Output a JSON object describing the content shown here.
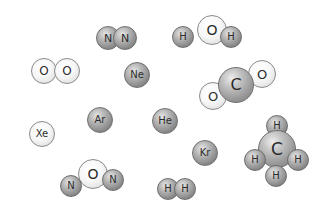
{
  "figure": {
    "colors": {
      "background": "#ffffff",
      "dark_atom": "#9a9a9a",
      "light_atom": "#f4f4f4",
      "outline": "#6e6e6e",
      "label": "#2b2b2b"
    },
    "molecules": [
      {
        "name": "nitrogen-molecule",
        "formula": "N2",
        "atoms": [
          {
            "label": "N",
            "x": 108,
            "y": 38,
            "r": 12,
            "style": "dark"
          },
          {
            "label": "N",
            "x": 125,
            "y": 38,
            "r": 12,
            "style": "dark"
          }
        ]
      },
      {
        "name": "water-molecule",
        "formula": "H2O",
        "atoms": [
          {
            "label": "O",
            "x": 212,
            "y": 30,
            "r": 15,
            "style": "light"
          },
          {
            "label": "H",
            "x": 183,
            "y": 37,
            "r": 11,
            "style": "dark"
          },
          {
            "label": "H",
            "x": 231,
            "y": 37,
            "r": 11,
            "style": "dark"
          }
        ]
      },
      {
        "name": "oxygen-molecule",
        "formula": "O2",
        "atoms": [
          {
            "label": "O",
            "x": 44,
            "y": 71,
            "r": 13,
            "style": "light"
          },
          {
            "label": "O",
            "x": 67,
            "y": 71,
            "r": 13,
            "style": "light"
          }
        ]
      },
      {
        "name": "neon-atom",
        "formula": "Ne",
        "atoms": [
          {
            "label": "Ne",
            "x": 137,
            "y": 75,
            "r": 13,
            "style": "dark"
          }
        ]
      },
      {
        "name": "carbon-dioxide-molecule",
        "formula": "CO2",
        "atoms": [
          {
            "label": "O",
            "x": 213,
            "y": 96,
            "r": 14,
            "style": "light"
          },
          {
            "label": "O",
            "x": 262,
            "y": 74,
            "r": 14,
            "style": "light"
          },
          {
            "label": "C",
            "x": 236,
            "y": 85,
            "r": 18,
            "style": "big"
          }
        ]
      },
      {
        "name": "xenon-atom",
        "formula": "Xe",
        "atoms": [
          {
            "label": "Xe",
            "x": 42,
            "y": 134,
            "r": 13,
            "style": "light"
          }
        ]
      },
      {
        "name": "argon-atom",
        "formula": "Ar",
        "atoms": [
          {
            "label": "Ar",
            "x": 100,
            "y": 120,
            "r": 13,
            "style": "dark"
          }
        ]
      },
      {
        "name": "helium-atom",
        "formula": "He",
        "atoms": [
          {
            "label": "He",
            "x": 165,
            "y": 121,
            "r": 13,
            "style": "dark"
          }
        ]
      },
      {
        "name": "krypton-atom",
        "formula": "Kr",
        "atoms": [
          {
            "label": "Kr",
            "x": 205,
            "y": 153,
            "r": 13,
            "style": "dark"
          }
        ]
      },
      {
        "name": "methane-molecule",
        "formula": "CH4",
        "atoms": [
          {
            "label": "H",
            "x": 277,
            "y": 126,
            "r": 11,
            "style": "dark"
          },
          {
            "label": "C",
            "x": 277,
            "y": 149,
            "r": 19,
            "style": "big"
          },
          {
            "label": "H",
            "x": 255,
            "y": 160,
            "r": 11,
            "style": "dark"
          },
          {
            "label": "H",
            "x": 298,
            "y": 160,
            "r": 11,
            "style": "dark"
          },
          {
            "label": "H",
            "x": 276,
            "y": 176,
            "r": 11,
            "style": "dark"
          }
        ]
      },
      {
        "name": "nitrous-oxide-molecule",
        "formula": "N2O",
        "atoms": [
          {
            "label": "O",
            "x": 93,
            "y": 174,
            "r": 15,
            "style": "light"
          },
          {
            "label": "N",
            "x": 71,
            "y": 186,
            "r": 11,
            "style": "dark"
          },
          {
            "label": "N",
            "x": 113,
            "y": 180,
            "r": 11,
            "style": "dark"
          }
        ]
      },
      {
        "name": "hydrogen-molecule",
        "formula": "H2",
        "atoms": [
          {
            "label": "H",
            "x": 168,
            "y": 189,
            "r": 11,
            "style": "dark"
          },
          {
            "label": "H",
            "x": 185,
            "y": 189,
            "r": 11,
            "style": "dark"
          }
        ]
      }
    ]
  }
}
